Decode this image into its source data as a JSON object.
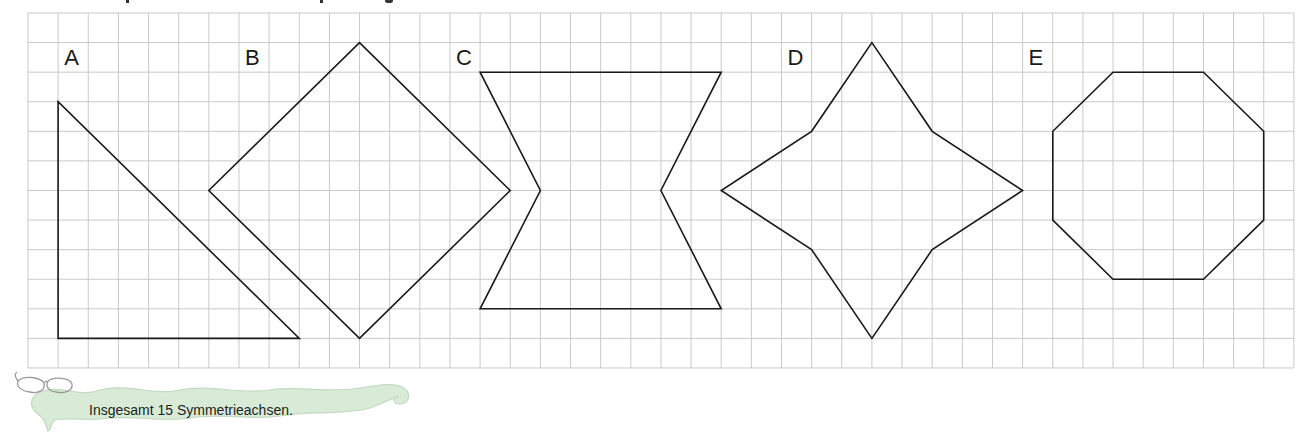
{
  "worksheet": {
    "grid": {
      "x0": 28,
      "y0": 13,
      "cols": 42,
      "rows": 12,
      "cell_w": 30.14,
      "cell_h": 29.58,
      "line_color": "#c9c9c9"
    },
    "shapes": [
      {
        "label": "A",
        "label_pos": [
          1.2,
          1.75
        ],
        "points": [
          [
            1,
            3
          ],
          [
            1,
            11
          ],
          [
            9,
            11
          ]
        ]
      },
      {
        "label": "B",
        "label_pos": [
          7.2,
          1.75
        ],
        "points": [
          [
            11,
            1
          ],
          [
            16,
            6
          ],
          [
            11,
            11
          ],
          [
            6,
            6
          ]
        ]
      },
      {
        "label": "C",
        "label_pos": [
          14.2,
          1.75
        ],
        "points": [
          [
            15,
            2
          ],
          [
            23,
            2
          ],
          [
            21,
            6
          ],
          [
            23,
            10
          ],
          [
            15,
            10
          ],
          [
            17,
            6
          ]
        ]
      },
      {
        "label": "D",
        "label_pos": [
          25.2,
          1.75
        ],
        "points": [
          [
            28,
            1
          ],
          [
            30,
            4
          ],
          [
            33,
            6
          ],
          [
            30,
            8
          ],
          [
            28,
            11
          ],
          [
            26,
            8
          ],
          [
            23,
            6
          ],
          [
            26,
            4
          ]
        ]
      },
      {
        "label": "E",
        "label_pos": [
          33.2,
          1.75
        ],
        "points": [
          [
            36,
            2
          ],
          [
            39,
            2
          ],
          [
            41,
            4
          ],
          [
            41,
            7
          ],
          [
            39,
            9
          ],
          [
            36,
            9
          ],
          [
            34,
            7
          ],
          [
            34,
            4
          ]
        ]
      }
    ],
    "shape_stroke": "#1a1a1a"
  },
  "answer_banner": {
    "icon": "glasses-icon",
    "text": "Insgesamt 15 Symmetrieachsen.",
    "fill": "#d8ebd6",
    "edge": "#c2d8c0"
  }
}
